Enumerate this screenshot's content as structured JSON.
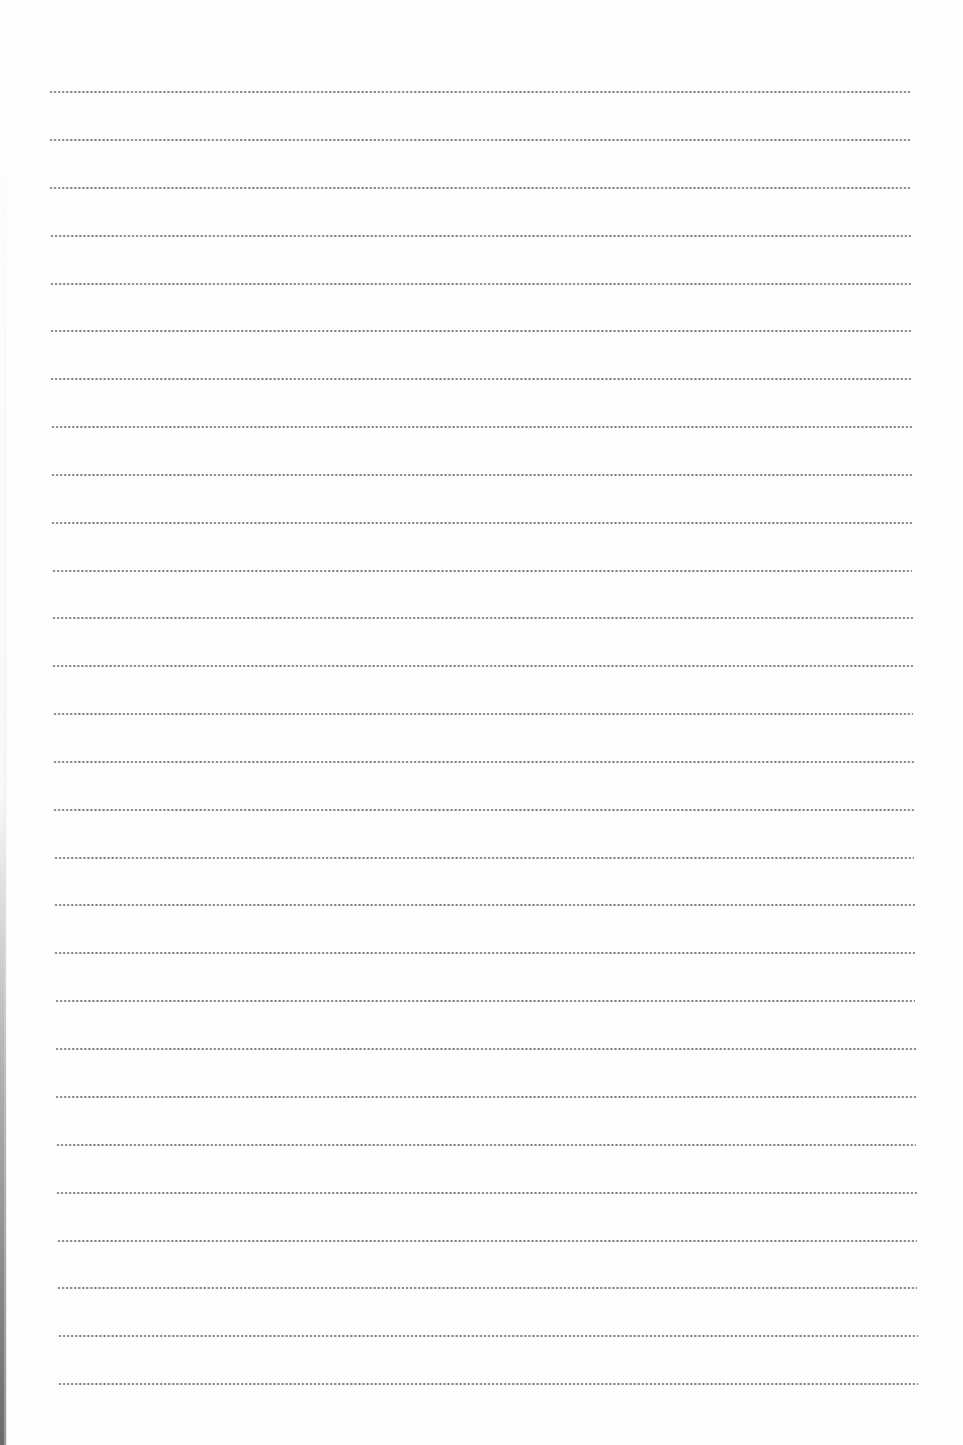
{
  "page": {
    "type": "ruled-notebook-page",
    "background_color": "#fefefe",
    "rule_style": "dotted",
    "rule_color": "#6e6e6e",
    "rule_count": 28,
    "rules": [
      {
        "y": 92,
        "x_start": 49,
        "x_end": 910
      },
      {
        "y": 140,
        "x_start": 49,
        "x_end": 910
      },
      {
        "y": 188,
        "x_start": 49,
        "x_end": 910
      },
      {
        "y": 236,
        "x_start": 50,
        "x_end": 911
      },
      {
        "y": 284,
        "x_start": 50,
        "x_end": 911
      },
      {
        "y": 331,
        "x_start": 50,
        "x_end": 911
      },
      {
        "y": 379,
        "x_start": 50,
        "x_end": 911
      },
      {
        "y": 427,
        "x_start": 51,
        "x_end": 912
      },
      {
        "y": 475,
        "x_start": 51,
        "x_end": 912
      },
      {
        "y": 523,
        "x_start": 51,
        "x_end": 912
      },
      {
        "y": 571,
        "x_start": 52,
        "x_end": 912
      },
      {
        "y": 618,
        "x_start": 52,
        "x_end": 913
      },
      {
        "y": 666,
        "x_start": 52,
        "x_end": 913
      },
      {
        "y": 714,
        "x_start": 53,
        "x_end": 913
      },
      {
        "y": 762,
        "x_start": 53,
        "x_end": 914
      },
      {
        "y": 810,
        "x_start": 53,
        "x_end": 914
      },
      {
        "y": 858,
        "x_start": 54,
        "x_end": 914
      },
      {
        "y": 905,
        "x_start": 54,
        "x_end": 915
      },
      {
        "y": 953,
        "x_start": 54,
        "x_end": 915
      },
      {
        "y": 1001,
        "x_start": 55,
        "x_end": 915
      },
      {
        "y": 1049,
        "x_start": 55,
        "x_end": 916
      },
      {
        "y": 1097,
        "x_start": 55,
        "x_end": 916
      },
      {
        "y": 1145,
        "x_start": 56,
        "x_end": 916
      },
      {
        "y": 1193,
        "x_start": 56,
        "x_end": 917
      },
      {
        "y": 1241,
        "x_start": 57,
        "x_end": 917
      },
      {
        "y": 1288,
        "x_start": 57,
        "x_end": 917
      },
      {
        "y": 1336,
        "x_start": 58,
        "x_end": 918
      },
      {
        "y": 1384,
        "x_start": 58,
        "x_end": 918
      }
    ]
  }
}
